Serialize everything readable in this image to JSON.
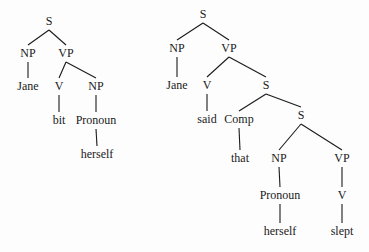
{
  "trees": [
    {
      "name": "tree-left",
      "sentence": "Jane bit herself",
      "nodes": [
        {
          "id": "S",
          "label": "S",
          "x": 49,
          "y": 25
        },
        {
          "id": "NP1",
          "label": "NP",
          "x": 28,
          "y": 57
        },
        {
          "id": "VP",
          "label": "VP",
          "x": 66,
          "y": 57
        },
        {
          "id": "Jane",
          "label": "Jane",
          "x": 28,
          "y": 90
        },
        {
          "id": "V",
          "label": "V",
          "x": 59,
          "y": 90
        },
        {
          "id": "NP2",
          "label": "NP",
          "x": 96,
          "y": 90
        },
        {
          "id": "bit",
          "label": "bit",
          "x": 59,
          "y": 124
        },
        {
          "id": "Pronoun",
          "label": "Pronoun",
          "x": 96,
          "y": 124
        },
        {
          "id": "herself",
          "label": "herself",
          "x": 97,
          "y": 158
        }
      ],
      "edges": [
        [
          "S",
          "NP1"
        ],
        [
          "S",
          "VP"
        ],
        [
          "NP1",
          "Jane"
        ],
        [
          "VP",
          "V"
        ],
        [
          "VP",
          "NP2"
        ],
        [
          "V",
          "bit"
        ],
        [
          "NP2",
          "Pronoun"
        ],
        [
          "Pronoun",
          "herself"
        ]
      ]
    },
    {
      "name": "tree-right",
      "sentence": "Jane said that herself slept",
      "nodes": [
        {
          "id": "S1",
          "label": "S",
          "x": 203,
          "y": 18
        },
        {
          "id": "NP1",
          "label": "NP",
          "x": 177,
          "y": 52
        },
        {
          "id": "VP1",
          "label": "VP",
          "x": 229,
          "y": 52
        },
        {
          "id": "Jane",
          "label": "Jane",
          "x": 177,
          "y": 89
        },
        {
          "id": "V1",
          "label": "V",
          "x": 207,
          "y": 89
        },
        {
          "id": "S2",
          "label": "S",
          "x": 266,
          "y": 89
        },
        {
          "id": "said",
          "label": "said",
          "x": 207,
          "y": 123
        },
        {
          "id": "Comp",
          "label": "Comp",
          "x": 239,
          "y": 123
        },
        {
          "id": "S3",
          "label": "S",
          "x": 301,
          "y": 119
        },
        {
          "id": "that",
          "label": "that",
          "x": 240,
          "y": 162
        },
        {
          "id": "NP2",
          "label": "NP",
          "x": 279,
          "y": 162
        },
        {
          "id": "VP2",
          "label": "VP",
          "x": 342,
          "y": 162
        },
        {
          "id": "Pronoun",
          "label": "Pronoun",
          "x": 280,
          "y": 199
        },
        {
          "id": "V2",
          "label": "V",
          "x": 342,
          "y": 199
        },
        {
          "id": "herself",
          "label": "herself",
          "x": 280,
          "y": 235
        },
        {
          "id": "slept",
          "label": "slept",
          "x": 342,
          "y": 235
        }
      ],
      "edges": [
        [
          "S1",
          "NP1"
        ],
        [
          "S1",
          "VP1"
        ],
        [
          "NP1",
          "Jane"
        ],
        [
          "VP1",
          "V1"
        ],
        [
          "VP1",
          "S2"
        ],
        [
          "V1",
          "said"
        ],
        [
          "S2",
          "Comp"
        ],
        [
          "S2",
          "S3"
        ],
        [
          "Comp",
          "that"
        ],
        [
          "S3",
          "NP2"
        ],
        [
          "S3",
          "VP2"
        ],
        [
          "NP2",
          "Pronoun"
        ],
        [
          "VP2",
          "V2"
        ],
        [
          "Pronoun",
          "herself"
        ],
        [
          "V2",
          "slept"
        ]
      ]
    }
  ]
}
